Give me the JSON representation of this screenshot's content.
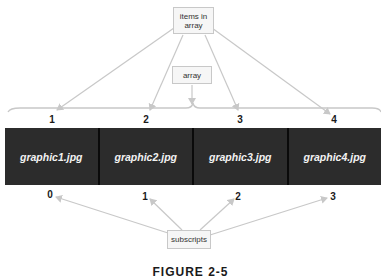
{
  "diagram": {
    "items_label": "items in array",
    "array_label": "array",
    "subscripts_label": "subscripts",
    "caption": "FIGURE 2-5",
    "item_numbers": [
      "1",
      "2",
      "3",
      "4"
    ],
    "cells": [
      "graphic1.jpg",
      "graphic2.jpg",
      "graphic3.jpg",
      "graphic4.jpg"
    ],
    "subscripts": [
      "0",
      "1",
      "2",
      "3"
    ],
    "colors": {
      "cell_fill": "#2c2c2c",
      "cell_border": "#0a0a0a",
      "cell_text": "#f2f2f2",
      "arrow": "#c8c8c8",
      "label_box_fill": "#f6f6f6",
      "label_box_border": "#c8c8c8"
    }
  }
}
